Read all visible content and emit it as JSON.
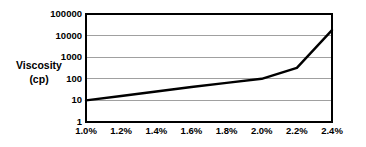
{
  "chart_data": {
    "type": "line",
    "title": "",
    "subtitle": "",
    "xlabel": "",
    "ylabel": "Viscosity (cp)",
    "ylabel_lines": [
      "Viscosity",
      "(cp)"
    ],
    "yscale": "log",
    "xscale": "linear",
    "ylim": [
      1,
      100000
    ],
    "xlim": [
      1.0,
      2.4
    ],
    "grid": "horizontal",
    "legend": "none",
    "y_ticks": [
      1,
      10,
      100,
      1000,
      10000,
      100000
    ],
    "y_tick_labels": [
      "1",
      "10",
      "100",
      "1000",
      "10000",
      "100000"
    ],
    "x_ticks": [
      1.0,
      1.2,
      1.4,
      1.6,
      1.8,
      2.0,
      2.2,
      2.4
    ],
    "x_tick_labels": [
      "1.0%",
      "1.2%",
      "1.4%",
      "1.6%",
      "1.8%",
      "2.0%",
      "2.2%",
      "2.4%"
    ],
    "series": [
      {
        "name": "Viscosity",
        "x": [
          1.0,
          1.2,
          1.4,
          1.6,
          1.8,
          2.0,
          2.1,
          2.2,
          2.4
        ],
        "values": [
          10,
          16,
          26,
          42,
          65,
          100,
          180,
          320,
          18000
        ]
      }
    ],
    "colors": {
      "line": "#000000",
      "grid": "#a0a0a0",
      "axis": "#000000",
      "text": "#000000",
      "background": "#ffffff"
    }
  },
  "plot_geometry": {
    "left": 86,
    "right": 332,
    "top": 14,
    "bottom": 122
  }
}
